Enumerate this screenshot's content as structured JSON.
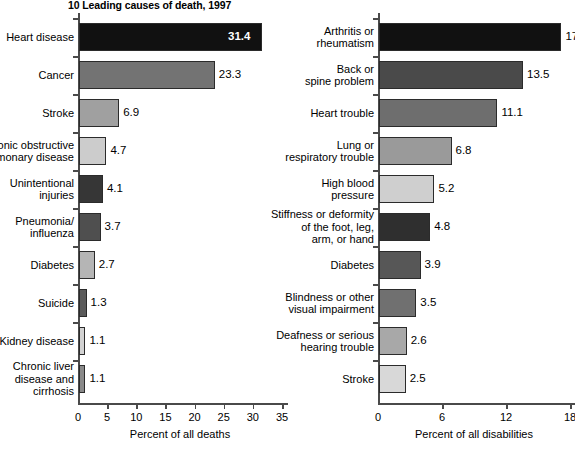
{
  "chart_data": [
    {
      "id": "deaths",
      "type": "bar",
      "orientation": "horizontal",
      "title": "10 Leading causes of death, 1997",
      "xlabel": "Percent of all deaths",
      "ylabel": "",
      "xlim": [
        0,
        35
      ],
      "xticks": [
        0,
        5,
        10,
        15,
        20,
        25,
        30,
        35
      ],
      "grid": false,
      "legend": "none",
      "categories": [
        "Heart disease",
        "Chronic obstructive\npulmonary disease",
        "Cancer",
        "Stroke",
        "Unintentional\ninjuries",
        "Pneumonia/\ninfluenza",
        "Diabetes",
        "Suicide",
        "Kidney disease",
        "Chronic liver\ndisease and\ncirrhosis"
      ],
      "bars": [
        {
          "label": "Heart disease",
          "value": 31.4,
          "value_text": "31.4",
          "color": "#111111",
          "label_inside": true
        },
        {
          "label": "Cancer",
          "value": 23.3,
          "value_text": "23.3",
          "color": "#737373",
          "label_inside": false
        },
        {
          "label": "Stroke",
          "value": 6.9,
          "value_text": "6.9",
          "color": "#a0a0a0",
          "label_inside": false
        },
        {
          "label": "Chronic obstructive\npulmonary disease",
          "value": 4.7,
          "value_text": "4.7",
          "color": "#cccccc",
          "label_inside": false
        },
        {
          "label": "Unintentional\ninjuries",
          "value": 4.1,
          "value_text": "4.1",
          "color": "#363636",
          "label_inside": false
        },
        {
          "label": "Pneumonia/\ninfluenza",
          "value": 3.7,
          "value_text": "3.7",
          "color": "#4f4f4f",
          "label_inside": false
        },
        {
          "label": "Diabetes",
          "value": 2.7,
          "value_text": "2.7",
          "color": "#b5b5b5",
          "label_inside": false
        },
        {
          "label": "Suicide",
          "value": 1.3,
          "value_text": "1.3",
          "color": "#5b5b5b",
          "label_inside": false
        },
        {
          "label": "Kidney disease",
          "value": 1.1,
          "value_text": "1.1",
          "color": "#d2d2d2",
          "label_inside": false
        },
        {
          "label": "Chronic liver\ndisease and\ncirrhosis",
          "value": 1.1,
          "value_text": "1.1",
          "color": "#8a8a8a",
          "label_inside": false
        }
      ]
    },
    {
      "id": "disabilities",
      "type": "bar",
      "orientation": "horizontal",
      "title": "",
      "xlabel": "Percent of all disabilities",
      "ylabel": "",
      "xlim": [
        0,
        18
      ],
      "xticks": [
        0,
        6,
        12,
        18
      ],
      "grid": false,
      "legend": "none",
      "categories": [
        "Arthritis or\nrheumatism",
        "Back or\nspine problem",
        "Heart trouble",
        "Lung or\nrespiratory trouble",
        "High blood\npressure",
        "Stiffness or deformity\nof the foot, leg,\narm, or hand",
        "Diabetes",
        "Blindness or other\nvisual impairment",
        "Deafness or serious\nhearing trouble",
        "Stroke"
      ],
      "bars": [
        {
          "label": "Arthritis or\nrheumatism",
          "value": 17.1,
          "value_text": "17.1",
          "color": "#111111",
          "label_inside": false
        },
        {
          "label": "Back or\nspine problem",
          "value": 13.5,
          "value_text": "13.5",
          "color": "#4a4a4a",
          "label_inside": false
        },
        {
          "label": "Heart trouble",
          "value": 11.1,
          "value_text": "11.1",
          "color": "#6e6e6e",
          "label_inside": false
        },
        {
          "label": "Lung or\nrespiratory trouble",
          "value": 6.8,
          "value_text": "6.8",
          "color": "#9a9a9a",
          "label_inside": false
        },
        {
          "label": "High blood\npressure",
          "value": 5.2,
          "value_text": "5.2",
          "color": "#cfcfcf",
          "label_inside": false
        },
        {
          "label": "Stiffness or deformity\nof the foot, leg,\narm, or hand",
          "value": 4.8,
          "value_text": "4.8",
          "color": "#2f2f2f",
          "label_inside": false
        },
        {
          "label": "Diabetes",
          "value": 3.9,
          "value_text": "3.9",
          "color": "#575757",
          "label_inside": false
        },
        {
          "label": "Blindness or other\nvisual impairment",
          "value": 3.5,
          "value_text": "3.5",
          "color": "#707070",
          "label_inside": false
        },
        {
          "label": "Deafness or serious\nhearing trouble",
          "value": 2.6,
          "value_text": "2.6",
          "color": "#a8a8a8",
          "label_inside": false
        },
        {
          "label": "Stroke",
          "value": 2.5,
          "value_text": "2.5",
          "color": "#d8d8d8",
          "label_inside": false
        }
      ]
    }
  ]
}
